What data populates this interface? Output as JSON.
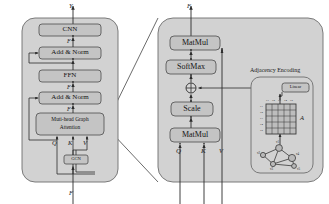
{
  "figure": {
    "colors": {
      "panel_fill": "#d2d2d2",
      "panel_stroke": "#6e6e6e",
      "box_fill": "#c4c4c4",
      "box_stroke": "#4d4d4d",
      "line": "#2b2b2b",
      "matrix_fill": "#bdbdbd",
      "matrix_stroke": "#3d3d3d",
      "node_fill": "#b9b9b9",
      "node_stroke": "#3a3a3a",
      "text": "#141414",
      "background": "#ffffff"
    }
  },
  "left_panel": {
    "name": "encoder-block",
    "output_label": "Y",
    "input_label": "F",
    "blocks": [
      {
        "id": "cnn",
        "label": "CNN"
      },
      {
        "id": "add-norm-2",
        "label": "Add & Norm"
      },
      {
        "id": "ffn",
        "label": "FFN"
      },
      {
        "id": "add-norm-1",
        "label": "Add & Norm"
      },
      {
        "id": "mhga",
        "label": "Muti-head Graph\nAttention",
        "line1": "Muti-head Graph",
        "line2": "Attention"
      },
      {
        "id": "gcn",
        "label": "GCN"
      }
    ],
    "flow_labels": [
      {
        "id": "f-cnn-in",
        "text": "F"
      },
      {
        "id": "f-ffn-out",
        "text": "F"
      },
      {
        "id": "f-attn-out",
        "text": "F"
      }
    ],
    "qkv": [
      {
        "id": "q",
        "text": "Q"
      },
      {
        "id": "k",
        "text": "K"
      },
      {
        "id": "v",
        "text": "V"
      }
    ]
  },
  "right_panel": {
    "name": "attention-detail",
    "output_label": "F",
    "blocks": [
      {
        "id": "matmul-top",
        "label": "MatMul"
      },
      {
        "id": "softmax",
        "label": "SoftMax"
      },
      {
        "id": "scale",
        "label": "Scale"
      },
      {
        "id": "matmul-bottom",
        "label": "MatMul"
      }
    ],
    "add_operator": "⊕",
    "qkv": [
      {
        "id": "q",
        "text": "Q"
      },
      {
        "id": "k",
        "text": "K"
      },
      {
        "id": "v",
        "text": "V"
      }
    ],
    "adjacency": {
      "title": "Adjacency Encoding",
      "linear_label": "Linear",
      "matrix_label": "A",
      "matrix_size": 5,
      "col_labels": [
        "v1",
        "v2",
        "v3",
        "v4",
        "v5"
      ],
      "row_labels": [
        "v1",
        "v2",
        "v3",
        "v4",
        "v5"
      ],
      "graph_nodes": [
        {
          "id": "v1",
          "label": "v1"
        },
        {
          "id": "v2",
          "label": "v2"
        },
        {
          "id": "v3",
          "label": "v3"
        },
        {
          "id": "v4",
          "label": "v4"
        },
        {
          "id": "v5",
          "label": "v5"
        }
      ]
    }
  }
}
